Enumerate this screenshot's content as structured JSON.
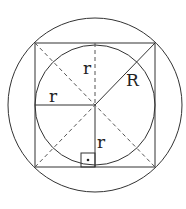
{
  "diagram": {
    "labels": {
      "r_top": "r",
      "r_left": "r",
      "r_bottom": "r",
      "R": "R",
      "right_angle_dot": "·"
    },
    "colors": {
      "stroke": "#333333",
      "background": "#ffffff"
    }
  }
}
